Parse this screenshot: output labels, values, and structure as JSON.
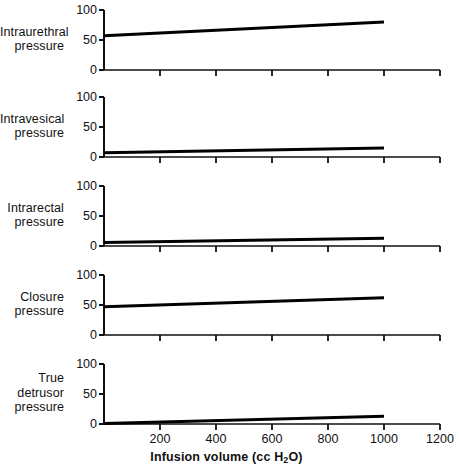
{
  "chart_data": {
    "type": "line",
    "title": "",
    "subtitle": "",
    "xlabel": "Infusion volume (cc H2O)",
    "xlabel_prefix": "Infusion volume (cc H",
    "xlabel_sub": "2",
    "xlabel_suffix": "O)",
    "xlim": [
      0,
      1200
    ],
    "xticks": [
      200,
      400,
      600,
      800,
      1000,
      1200
    ],
    "xticklabels": [
      "200",
      "400",
      "600",
      "800",
      "1000",
      "1200"
    ],
    "ylim": [
      0,
      100
    ],
    "yticks": [
      0,
      50,
      100
    ],
    "yticklabels": [
      "0",
      "50",
      "100"
    ],
    "grid": false,
    "legend": false,
    "units": "cm H2O",
    "panels": [
      {
        "id": "intraurethral",
        "label_lines": [
          "Intraurethral",
          "pressure"
        ],
        "ylabel": "Intraurethral pressure",
        "x": [
          0,
          1000
        ],
        "values": [
          57,
          80
        ],
        "series_name": "Intraurethral pressure"
      },
      {
        "id": "intravesical",
        "label_lines": [
          "Intravesical",
          "pressure"
        ],
        "ylabel": "Intravesical pressure",
        "x": [
          0,
          1000
        ],
        "values": [
          7,
          15
        ],
        "series_name": "Intravesical pressure"
      },
      {
        "id": "intrarectal",
        "label_lines": [
          "Intrarectal",
          "pressure"
        ],
        "ylabel": "Intrarectal pressure",
        "x": [
          0,
          1000
        ],
        "values": [
          6,
          13
        ],
        "series_name": "Intrarectal pressure"
      },
      {
        "id": "closure",
        "label_lines": [
          "Closure",
          "pressure"
        ],
        "ylabel": "Closure pressure",
        "x": [
          0,
          1000
        ],
        "values": [
          47,
          62
        ],
        "series_name": "Closure pressure"
      },
      {
        "id": "true-detrusor",
        "label_lines": [
          "True",
          "detrusor",
          "pressure"
        ],
        "ylabel": "True detrusor pressure",
        "x": [
          0,
          1000
        ],
        "values": [
          1,
          13
        ],
        "series_name": "True detrusor pressure"
      }
    ]
  },
  "axis_color": "#111111",
  "line_color": "#000000"
}
